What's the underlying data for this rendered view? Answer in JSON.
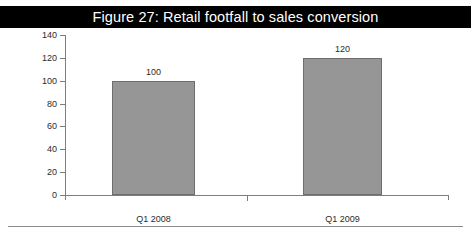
{
  "figure": {
    "title": "Figure 27: Retail footfall to sales conversion",
    "title_band_color": "#000000",
    "title_text_color": "#ffffff"
  },
  "chart_data": {
    "type": "bar",
    "title": "Figure 27: Retail footfall to sales conversion",
    "xlabel": "",
    "ylabel": "",
    "categories": [
      "Q1 2008",
      "Q1 2009"
    ],
    "values": [
      100,
      120
    ],
    "data_labels": [
      "100",
      "120"
    ],
    "ylim": [
      0,
      140
    ],
    "yticks": [
      0,
      20,
      40,
      60,
      80,
      100,
      120,
      140
    ],
    "ytick_labels": [
      "0",
      "20",
      "40",
      "60",
      "80",
      "100",
      "120",
      "140"
    ],
    "grid": false,
    "legend": false,
    "bar_fill_color": "#969696",
    "bar_border_color": "#6e6e6e",
    "axis_color": "#7d7d7d"
  }
}
